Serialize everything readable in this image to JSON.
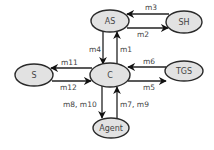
{
  "diagram": {
    "colors": {
      "node_fill": "#e2e2e2",
      "node_stroke": "#2a2a2a",
      "edge": "#222222",
      "text": "#444444",
      "background": "#ffffff"
    },
    "nodes": {
      "as": {
        "label": "AS",
        "cx": 110,
        "cy": 21,
        "rx": 19,
        "ry": 11
      },
      "sh": {
        "label": "SH",
        "cx": 184,
        "cy": 22,
        "rx": 18,
        "ry": 11
      },
      "c": {
        "label": "C",
        "cx": 110,
        "cy": 75,
        "rx": 20,
        "ry": 12
      },
      "s": {
        "label": "S",
        "cx": 34,
        "cy": 75,
        "rx": 19,
        "ry": 11
      },
      "tgs": {
        "label": "TGS",
        "cx": 184,
        "cy": 71,
        "rx": 19,
        "ry": 10
      },
      "agent": {
        "label": "Agent",
        "cx": 111,
        "cy": 128,
        "rx": 18,
        "ry": 10
      }
    },
    "edges": [
      {
        "id": "m1",
        "label": "m1",
        "from": "C",
        "to": "AS"
      },
      {
        "id": "m2",
        "label": "m2",
        "from": "AS",
        "to": "SH"
      },
      {
        "id": "m3",
        "label": "m3",
        "from": "SH",
        "to": "AS"
      },
      {
        "id": "m4",
        "label": "m4",
        "from": "AS",
        "to": "C"
      },
      {
        "id": "m5",
        "label": "m5",
        "from": "C",
        "to": "TGS"
      },
      {
        "id": "m6",
        "label": "m6",
        "from": "TGS",
        "to": "C"
      },
      {
        "id": "m7_m9",
        "label": "m7, m9",
        "from": "Agent",
        "to": "C"
      },
      {
        "id": "m8_m10",
        "label": "m8, m10",
        "from": "C",
        "to": "Agent"
      },
      {
        "id": "m11",
        "label": "m11",
        "from": "C",
        "to": "S"
      },
      {
        "id": "m12",
        "label": "m12",
        "from": "S",
        "to": "C"
      }
    ]
  }
}
